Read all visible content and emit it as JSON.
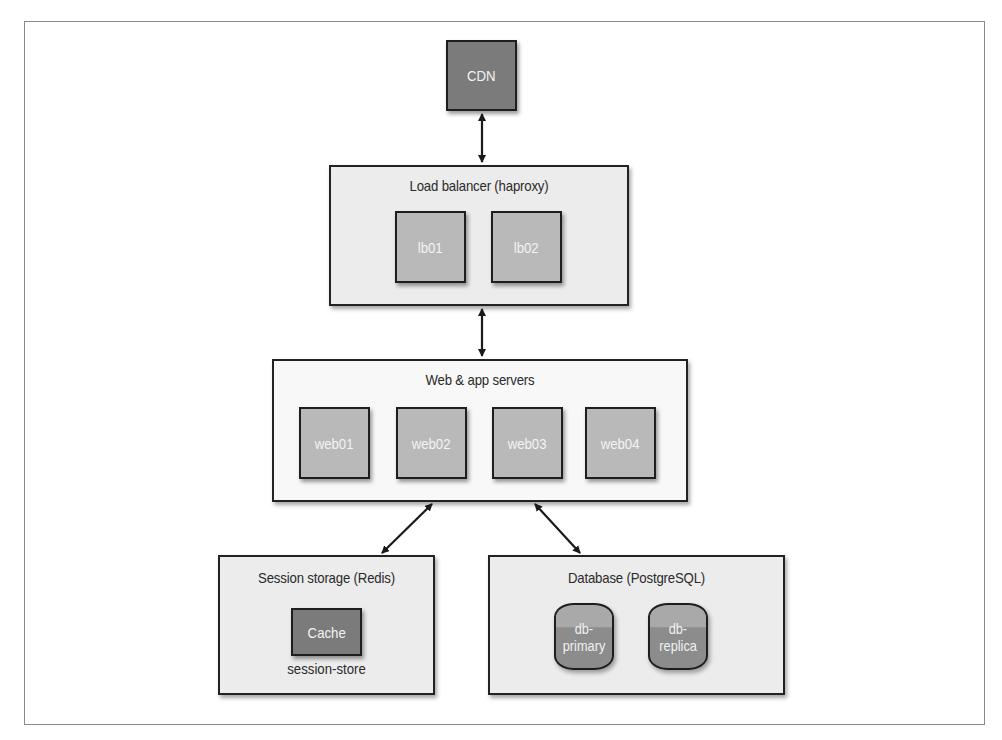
{
  "diagram": {
    "cdn": {
      "label": "CDN"
    },
    "load_balancer": {
      "title": "Load balancer (haproxy)",
      "nodes": [
        {
          "label": "lb01"
        },
        {
          "label": "lb02"
        }
      ]
    },
    "web_servers": {
      "title": "Web & app servers",
      "nodes": [
        {
          "label": "web01"
        },
        {
          "label": "web02"
        },
        {
          "label": "web03"
        },
        {
          "label": "web04"
        }
      ]
    },
    "session_storage": {
      "title": "Session storage (Redis)",
      "node": {
        "label": "Cache"
      },
      "caption": "session-store"
    },
    "database": {
      "title": "Database (PostgreSQL)",
      "nodes": [
        {
          "line1": "db-",
          "line2": "primary"
        },
        {
          "line1": "db-",
          "line2": "replica"
        }
      ]
    },
    "connections": [
      {
        "from": "CDN",
        "to": "Load balancer (haproxy)",
        "type": "bidirectional"
      },
      {
        "from": "Load balancer (haproxy)",
        "to": "Web & app servers",
        "type": "bidirectional"
      },
      {
        "from": "Web & app servers",
        "to": "Session storage (Redis)",
        "type": "bidirectional"
      },
      {
        "from": "Web & app servers",
        "to": "Database (PostgreSQL)",
        "type": "bidirectional"
      }
    ],
    "colors": {
      "dark_node": "#7b7b7b",
      "light_node": "#b9b9b9",
      "group_fill": "#ececec",
      "border": "#1e1e1e"
    }
  }
}
